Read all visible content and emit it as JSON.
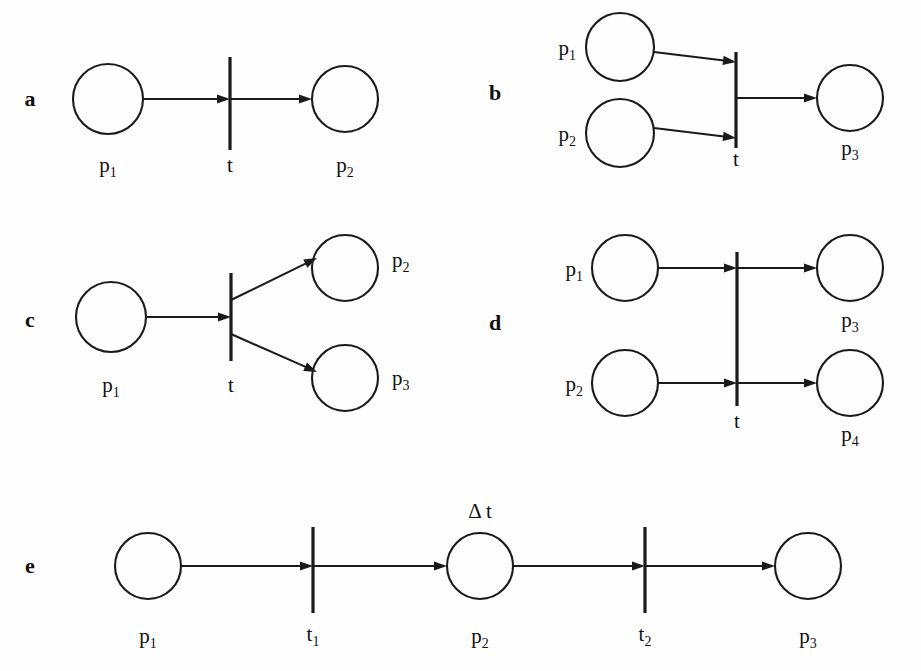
{
  "figure": {
    "kind": "petri-net-primitives",
    "background_color": "#fefefe",
    "ink_color": "#1a1a1a",
    "width": 921,
    "height": 671
  },
  "panels": [
    {
      "id": "a",
      "letter": "a",
      "letter_x": 30,
      "letter_y": 106,
      "description": "sequence: one place into one transition into one place",
      "places": [
        {
          "name": "p1",
          "label": "p",
          "sub": "1",
          "cx": 108,
          "cy": 99,
          "r": 35,
          "label_x": 108,
          "label_y": 172,
          "label_anchor": "middle"
        },
        {
          "name": "p2",
          "label": "p",
          "sub": "2",
          "cx": 345,
          "cy": 99,
          "r": 33,
          "label_x": 345,
          "label_y": 172,
          "label_anchor": "middle"
        }
      ],
      "transitions": [
        {
          "name": "t",
          "label": "t",
          "sub": "",
          "x": 230,
          "y1": 57,
          "y2": 150,
          "label_x": 230,
          "label_y": 172,
          "label_anchor": "middle"
        }
      ],
      "arcs": [
        {
          "name": "arc-p1-t",
          "x1": 143,
          "y1": 99,
          "x2": 230,
          "y2": 99
        },
        {
          "name": "arc-t-p2",
          "x1": 230,
          "y1": 99,
          "x2": 312,
          "y2": 99
        }
      ]
    },
    {
      "id": "b",
      "letter": "b",
      "letter_x": 495,
      "letter_y": 100,
      "description": "synchronization: two places join into one transition into one place",
      "places": [
        {
          "name": "p1",
          "label": "p",
          "sub": "1",
          "cx": 620,
          "cy": 47,
          "r": 34,
          "label_x": 576,
          "label_y": 55,
          "label_anchor": "end"
        },
        {
          "name": "p2",
          "label": "p",
          "sub": "2",
          "cx": 620,
          "cy": 133,
          "r": 34,
          "label_x": 576,
          "label_y": 141,
          "label_anchor": "end"
        },
        {
          "name": "p3",
          "label": "p",
          "sub": "3",
          "cx": 850,
          "cy": 98,
          "r": 33,
          "label_x": 850,
          "label_y": 155,
          "label_anchor": "middle"
        }
      ],
      "transitions": [
        {
          "name": "t",
          "label": "t",
          "sub": "",
          "x": 736,
          "y1": 52,
          "y2": 148,
          "label_x": 736,
          "label_y": 166,
          "label_anchor": "middle"
        }
      ],
      "arcs": [
        {
          "name": "arc-p1-t",
          "x1": 654,
          "y1": 52,
          "x2": 736,
          "y2": 62
        },
        {
          "name": "arc-p2-t",
          "x1": 654,
          "y1": 128,
          "x2": 736,
          "y2": 138
        },
        {
          "name": "arc-t-p3",
          "x1": 736,
          "y1": 98,
          "x2": 817,
          "y2": 98
        }
      ]
    },
    {
      "id": "c",
      "letter": "c",
      "letter_x": 30,
      "letter_y": 327,
      "description": "fork: one place into one transition splitting into two places",
      "places": [
        {
          "name": "p1",
          "label": "p",
          "sub": "1",
          "cx": 111,
          "cy": 317,
          "r": 35,
          "label_x": 111,
          "label_y": 392,
          "label_anchor": "middle"
        },
        {
          "name": "p2",
          "label": "p",
          "sub": "2",
          "cx": 345,
          "cy": 268,
          "r": 33,
          "label_x": 392,
          "label_y": 267,
          "label_anchor": "start"
        },
        {
          "name": "p3",
          "label": "p",
          "sub": "3",
          "cx": 345,
          "cy": 378,
          "r": 33,
          "label_x": 392,
          "label_y": 385,
          "label_anchor": "start"
        }
      ],
      "transitions": [
        {
          "name": "t",
          "label": "t",
          "sub": "",
          "x": 231,
          "y1": 273,
          "y2": 361,
          "label_x": 231,
          "label_y": 392,
          "label_anchor": "middle"
        }
      ],
      "arcs": [
        {
          "name": "arc-p1-t",
          "x1": 146,
          "y1": 317,
          "x2": 231,
          "y2": 317
        },
        {
          "name": "arc-t-p2",
          "x1": 231,
          "y1": 300,
          "x2": 317,
          "y2": 258
        },
        {
          "name": "arc-t-p3",
          "x1": 231,
          "y1": 334,
          "x2": 317,
          "y2": 372
        }
      ]
    },
    {
      "id": "d",
      "letter": "d",
      "letter_x": 495,
      "letter_y": 330,
      "description": "one transition with two independent parallel place pairs",
      "places": [
        {
          "name": "p1",
          "label": "p",
          "sub": "1",
          "cx": 625,
          "cy": 268,
          "r": 33,
          "label_x": 583,
          "label_y": 276,
          "label_anchor": "end"
        },
        {
          "name": "p2",
          "label": "p",
          "sub": "2",
          "cx": 625,
          "cy": 383,
          "r": 33,
          "label_x": 583,
          "label_y": 391,
          "label_anchor": "end"
        },
        {
          "name": "p3",
          "label": "p",
          "sub": "3",
          "cx": 850,
          "cy": 268,
          "r": 33,
          "label_x": 850,
          "label_y": 327,
          "label_anchor": "middle"
        },
        {
          "name": "p4",
          "label": "p",
          "sub": "4",
          "cx": 850,
          "cy": 383,
          "r": 33,
          "label_x": 850,
          "label_y": 441,
          "label_anchor": "middle"
        }
      ],
      "transitions": [
        {
          "name": "t",
          "label": "t",
          "sub": "",
          "x": 737,
          "y1": 252,
          "y2": 406,
          "label_x": 737,
          "label_y": 428,
          "label_anchor": "middle"
        }
      ],
      "arcs": [
        {
          "name": "arc-p1-t",
          "x1": 658,
          "y1": 268,
          "x2": 737,
          "y2": 268
        },
        {
          "name": "arc-t-p3",
          "x1": 737,
          "y1": 268,
          "x2": 817,
          "y2": 268
        },
        {
          "name": "arc-p2-t",
          "x1": 658,
          "y1": 383,
          "x2": 737,
          "y2": 383
        },
        {
          "name": "arc-t-p4",
          "x1": 737,
          "y1": 383,
          "x2": 817,
          "y2": 383
        }
      ]
    },
    {
      "id": "e",
      "letter": "e",
      "letter_x": 30,
      "letter_y": 573,
      "description": "timed sequence with delay annotation on the middle place",
      "places": [
        {
          "name": "p1",
          "label": "p",
          "sub": "1",
          "cx": 148,
          "cy": 566,
          "r": 33,
          "label_x": 148,
          "label_y": 643,
          "label_anchor": "middle"
        },
        {
          "name": "p2",
          "label": "p",
          "sub": "2",
          "cx": 480,
          "cy": 566,
          "r": 33,
          "label_x": 480,
          "label_y": 643,
          "label_anchor": "middle"
        },
        {
          "name": "p3",
          "label": "p",
          "sub": "3",
          "cx": 808,
          "cy": 566,
          "r": 33,
          "label_x": 808,
          "label_y": 643,
          "label_anchor": "middle"
        }
      ],
      "transitions": [
        {
          "name": "t1",
          "label": "t",
          "sub": "1",
          "x": 313,
          "y1": 527,
          "y2": 613,
          "label_x": 313,
          "label_y": 641,
          "label_anchor": "middle"
        },
        {
          "name": "t2",
          "label": "t",
          "sub": "2",
          "x": 645,
          "y1": 527,
          "y2": 613,
          "label_x": 645,
          "label_y": 641,
          "label_anchor": "middle"
        }
      ],
      "arcs": [
        {
          "name": "arc-p1-t1",
          "x1": 181,
          "y1": 566,
          "x2": 313,
          "y2": 566
        },
        {
          "name": "arc-t1-p2",
          "x1": 313,
          "y1": 566,
          "x2": 447,
          "y2": 566
        },
        {
          "name": "arc-p2-t2",
          "x1": 513,
          "y1": 566,
          "x2": 645,
          "y2": 566
        },
        {
          "name": "arc-t2-p3",
          "x1": 645,
          "y1": 566,
          "x2": 775,
          "y2": 566
        }
      ],
      "annotations": [
        {
          "name": "delay-label",
          "text": "Δ t",
          "x": 480,
          "y": 518,
          "anchor": "middle"
        }
      ]
    }
  ]
}
